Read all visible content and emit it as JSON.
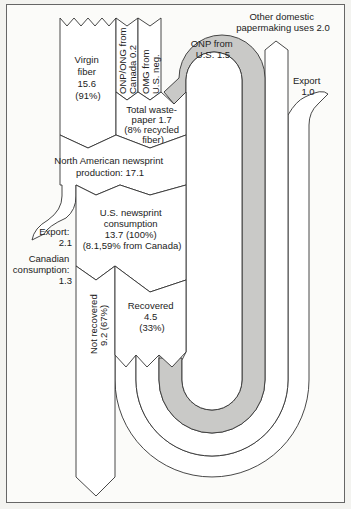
{
  "diagram": {
    "title": "",
    "units": "million tons",
    "colors": {
      "recycled_flow": "#c9c9c7",
      "flow": "#ffffff",
      "outline": "#333333",
      "frame": "#666666"
    },
    "labels": {
      "virgin_fiber": [
        "Virgin",
        "fiber",
        "15.6",
        "(91%)"
      ],
      "onp_ong_canada": [
        "ONP/ONG from",
        "Canada 0.2"
      ],
      "omg_us": [
        "OMG from",
        "U.S. neg."
      ],
      "total_wastepaper": [
        "Total waste-",
        "paper 1.7",
        "(8% recycled",
        "fiber)"
      ],
      "na_production": [
        "North American newsprint",
        "production: 17.1"
      ],
      "export_left": [
        "Export:",
        "2.1"
      ],
      "canadian_consumption": [
        "Canadian",
        "consumption:",
        "1.3"
      ],
      "us_consumption": [
        "U.S. newsprint",
        "consumption",
        "13.7 (100%)",
        "(8.1,59% from Canada)"
      ],
      "not_recovered": [
        "Not recovered",
        "9.2 (67%)"
      ],
      "recovered": [
        "Recovered",
        "4.5",
        "(33%)"
      ],
      "onp_us": [
        "ONP from",
        "U.S. 1.5"
      ],
      "other_domestic": [
        "Other domestic",
        "papermaking uses 2.0"
      ],
      "export_right": [
        "Export",
        "1.0"
      ]
    },
    "flows": [
      {
        "from": "Virgin fiber",
        "to": "North American newsprint production",
        "value": 15.6
      },
      {
        "from": "Total wastepaper",
        "to": "North American newsprint production",
        "value": 1.7
      },
      {
        "from": "ONP/ONG from Canada",
        "to": "Total wastepaper",
        "value": 0.2
      },
      {
        "from": "OMG from U.S.",
        "to": "Total wastepaper",
        "value": "neg."
      },
      {
        "from": "ONP from U.S.",
        "to": "Total wastepaper",
        "value": 1.5
      },
      {
        "from": "North American newsprint production",
        "to": "Export",
        "value": 2.1
      },
      {
        "from": "North American newsprint production",
        "to": "Canadian consumption",
        "value": 1.3
      },
      {
        "from": "North American newsprint production",
        "to": "U.S. newsprint consumption",
        "value": 13.7
      },
      {
        "from": "U.S. newsprint consumption",
        "to": "Not recovered",
        "value": 9.2
      },
      {
        "from": "U.S. newsprint consumption",
        "to": "Recovered",
        "value": 4.5
      },
      {
        "from": "Recovered",
        "to": "Other domestic papermaking uses",
        "value": 2.0
      },
      {
        "from": "Recovered",
        "to": "Export",
        "value": 1.0
      }
    ]
  }
}
